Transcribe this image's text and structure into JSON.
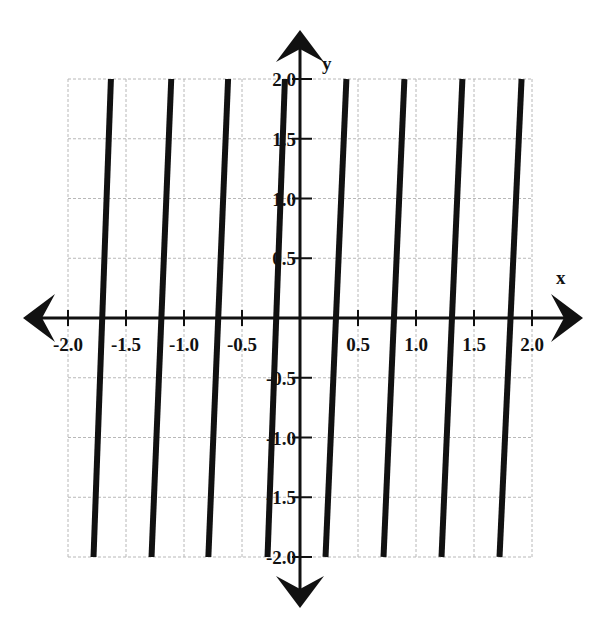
{
  "chart_data": {
    "type": "line",
    "title": "",
    "xlabel": "x",
    "ylabel": "y",
    "xlim": [
      -2.0,
      2.0
    ],
    "ylim": [
      -2.0,
      2.0
    ],
    "grid": true,
    "x_ticks": [
      -2.0,
      -1.5,
      -1.0,
      -0.5,
      0.5,
      1.0,
      1.5,
      2.0
    ],
    "x_tick_labels": [
      "-2.0",
      "-1.5",
      "-1.0",
      "-0.5",
      "0.5",
      "1.0",
      "1.5",
      "2.0"
    ],
    "y_ticks": [
      2.0,
      1.5,
      1.0,
      0.5,
      -0.5,
      -1.0,
      -1.5,
      -2.0
    ],
    "y_tick_labels": [
      "2.0",
      "1.5",
      "1.0",
      "0.5",
      "-0.5",
      "-1.0",
      "-1.5",
      "-2.0"
    ],
    "series": [
      {
        "name": "segment-1",
        "x": [
          -1.78,
          -1.63
        ],
        "y": [
          -2.0,
          2.0
        ]
      },
      {
        "name": "segment-2",
        "x": [
          -1.28,
          -1.11
        ],
        "y": [
          -2.0,
          2.0
        ]
      },
      {
        "name": "segment-3",
        "x": [
          -0.79,
          -0.62
        ],
        "y": [
          -2.0,
          2.0
        ]
      },
      {
        "name": "segment-4",
        "x": [
          -0.28,
          -0.13
        ],
        "y": [
          -2.0,
          2.0
        ]
      },
      {
        "name": "segment-5",
        "x": [
          0.22,
          0.4
        ],
        "y": [
          -2.0,
          2.0
        ]
      },
      {
        "name": "segment-6",
        "x": [
          0.72,
          0.9
        ],
        "y": [
          -2.0,
          2.0
        ]
      },
      {
        "name": "segment-7",
        "x": [
          1.22,
          1.4
        ],
        "y": [
          -2.0,
          2.0
        ]
      },
      {
        "name": "segment-8",
        "x": [
          1.72,
          1.91
        ],
        "y": [
          -2.0,
          2.0
        ]
      }
    ],
    "colors": {
      "line": "#111111",
      "grid": "#b8b8b8",
      "axis": "#111111"
    }
  }
}
